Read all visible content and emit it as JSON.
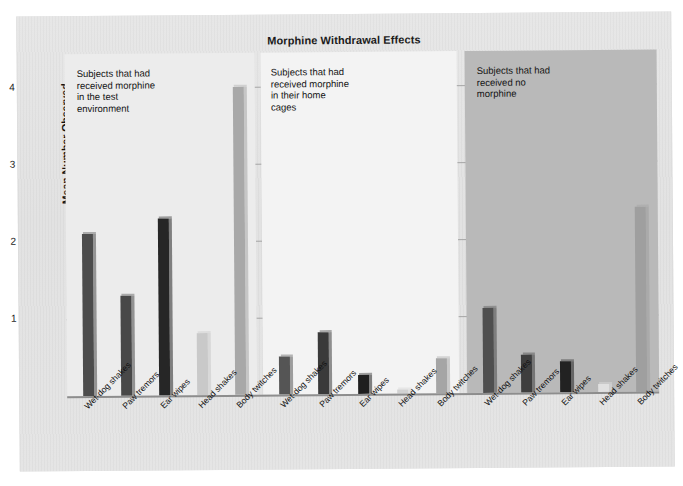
{
  "chart_data": {
    "type": "bar",
    "title": "Morphine Withdrawal Effects",
    "xlabel": "",
    "ylabel": "Mean Number Observed",
    "ylim": [
      0,
      4
    ],
    "yticks": [
      "1",
      "2",
      "3",
      "4"
    ],
    "grid": true,
    "legend": "none",
    "categories": [
      "Wet-dog shakes",
      "Paw tremors",
      "Ear wipes",
      "Head shakes",
      "Body twitches"
    ],
    "groups": [
      {
        "name": "Subjects that had received morphine in the test environment",
        "note_lines": "Subjects that had\nreceived morphine\nin the test\nenvironment",
        "values": [
          2.1,
          1.3,
          2.3,
          0.8,
          4.0
        ],
        "bar_colors": [
          "#4c4c4c",
          "#484848",
          "#262626",
          "#c9c9c9",
          "#a8a8a8"
        ]
      },
      {
        "name": "Subjects that had received morphine in their home cages",
        "note_lines": "Subjects that had\nreceived morphine\nin their home\ncages",
        "values": [
          0.5,
          0.8,
          0.25,
          0.05,
          0.45
        ],
        "bar_colors": [
          "#555555",
          "#3a3a3a",
          "#1f1f1f",
          "#d2d2d2",
          "#a5a5a5"
        ]
      },
      {
        "name": "Subjects that had received no morphine",
        "note_lines": "Subjects that had\nreceived no\nmorphine",
        "values": [
          1.1,
          0.5,
          0.4,
          0.1,
          2.4
        ],
        "bar_colors": [
          "#4f4f4f",
          "#3e3e3e",
          "#222222",
          "#e0e0e0",
          "#9f9f9f"
        ]
      }
    ],
    "annotations": []
  },
  "figure": {
    "title": "Morphine Withdrawal Effects",
    "y_axis_title": "Mean Number Observed",
    "tick_4": "4",
    "tick_3": "3",
    "tick_2": "2",
    "tick_1": "1",
    "group_note_1": "Subjects that had\nreceived morphine\nin the test\nenvironment",
    "group_note_2": "Subjects that had\nreceived morphine\nin their home\ncages",
    "group_note_3": "Subjects that had\nreceived no\nmorphine",
    "colors": {
      "paper": "#e3e3e3",
      "panel_light": "#ececec",
      "panel_lighter": "#f3f3f3",
      "panel_dark": "#b9b9b9",
      "gridline": "#9a9a9a",
      "text": "#121212"
    }
  }
}
